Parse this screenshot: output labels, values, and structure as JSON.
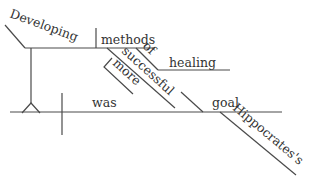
{
  "diagram": {
    "type": "sentence-diagram",
    "sentence_words": {
      "subject_gerund": "Developing",
      "gerund_object": "methods",
      "object_modifier_prep": "of",
      "prep_object": "healing",
      "adjective": "successful",
      "adverb": "more",
      "verb": "was",
      "predicate_noun": "goal",
      "possessive": "Hippocrates's"
    },
    "line_color": "#4a4a4a",
    "text_color": "#333333"
  }
}
